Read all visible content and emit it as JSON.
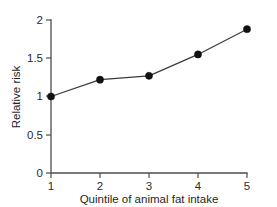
{
  "chart_data": {
    "type": "line",
    "title": "",
    "subtitle": "",
    "xlabel": "Quintile of animal fat intake",
    "ylabel": "Relative risk",
    "x": [
      1,
      2,
      3,
      4,
      5
    ],
    "categories": [
      "1",
      "2",
      "3",
      "4",
      "5"
    ],
    "values": [
      1.0,
      1.22,
      1.27,
      1.55,
      1.88
    ],
    "series": [
      {
        "name": "Relative risk",
        "values": [
          1.0,
          1.22,
          1.27,
          1.55,
          1.88
        ]
      }
    ],
    "xlim": [
      1,
      5
    ],
    "ylim": [
      0,
      2
    ],
    "xticks": [
      "1",
      "2",
      "3",
      "4",
      "5"
    ],
    "yticks": [
      "0",
      "0.5",
      "1",
      "1.5",
      "2"
    ],
    "ytick_values": [
      0,
      0.5,
      1,
      1.5,
      2
    ],
    "grid": false,
    "legend": false,
    "legend_position": "none",
    "marker": "filled-circle",
    "colors": {
      "line": "#3a3a3a",
      "marker": "#111111",
      "axis": "#4d4d4d",
      "background": "#ffffff",
      "text": "#1f1f1f"
    }
  }
}
